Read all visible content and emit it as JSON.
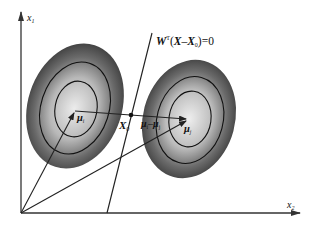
{
  "diagram": {
    "type": "linear-discriminant-decision-boundary",
    "axes": {
      "y_label": {
        "base": "x",
        "sub": "1"
      },
      "x_label": {
        "base": "x",
        "sub": "2"
      }
    },
    "boundary_equation": {
      "W": "W",
      "sup": "T",
      "open": "(",
      "X": "X",
      "minus": "–",
      "X0": "X",
      "X0_sub": "0",
      "close": ")=0"
    },
    "point_label": {
      "base": "X",
      "sub": "0"
    },
    "mean_i": {
      "base": "μ",
      "sub": "i"
    },
    "mean_j": {
      "base": "μ",
      "sub": "j"
    },
    "difference_label": {
      "a": "μ",
      "a_sub": "i",
      "minus": "–",
      "b": "μ",
      "b_sub": "j"
    },
    "colors": {
      "axis": "#333333",
      "line": "#222222",
      "cluster_outer": "#3a3a3a",
      "cluster_inner": "#e6e6e6"
    }
  }
}
